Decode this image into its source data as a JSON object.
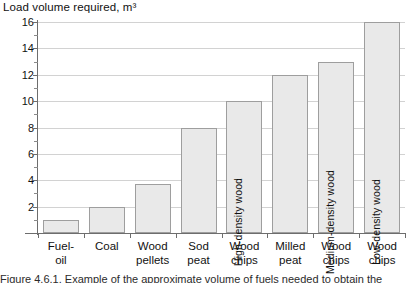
{
  "chart_data": {
    "type": "bar",
    "title": "Load volume required, m³",
    "xlabel": "",
    "ylabel": "",
    "ylim": [
      0,
      16
    ],
    "ytick_step": 2,
    "yticks": [
      2,
      4,
      6,
      8,
      10,
      12,
      14,
      16
    ],
    "minor_yticks": [
      1,
      3,
      5,
      7,
      9,
      11,
      13,
      15
    ],
    "grid": true,
    "legend": "none",
    "categories": [
      "Fuel-oil",
      "Coal",
      "Wood pellets",
      "Sod peat",
      "Wood chips",
      "Milled peat",
      "Wood chips",
      "Wood chips"
    ],
    "values": [
      1,
      2,
      3.7,
      8,
      10,
      12,
      13,
      16
    ],
    "bar_annotations": [
      "",
      "",
      "",
      "",
      "High-density wood",
      "",
      "Medium-density wood",
      "Low-density wood"
    ]
  },
  "axis": {
    "y_tick_labels": [
      "16",
      "14",
      "12",
      "10",
      "8",
      "6",
      "4",
      "2"
    ],
    "x_tick_labels": [
      [
        "Fuel-",
        "oil"
      ],
      [
        "Coal",
        ""
      ],
      [
        "Wood",
        "pellets"
      ],
      [
        "Sod",
        "peat"
      ],
      [
        "Wood",
        "chips"
      ],
      [
        "Milled",
        "peat"
      ],
      [
        "Wood",
        "chips"
      ],
      [
        "Wood",
        "chips"
      ]
    ]
  },
  "caption": {
    "text": "Figure 4.6.1. Example of the approximate volume of fuels needed to obtain the"
  },
  "style": {
    "bar_fill": "#e9e9e9",
    "bar_border": "#9e9e9e",
    "gridline": "#d2d2d2",
    "axis": "#6d6d6d",
    "text": "#111111"
  }
}
